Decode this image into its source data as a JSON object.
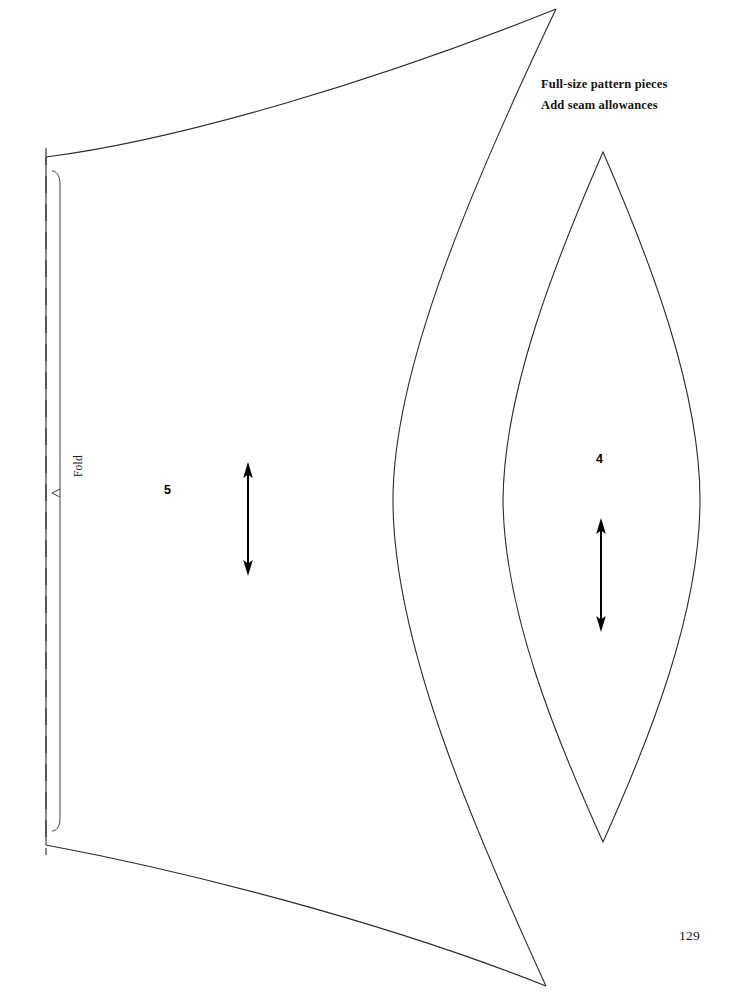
{
  "sheet": {
    "title": "Full-size sewing pattern sheet",
    "background_color": "#ffffff",
    "ink_color": "#1a1a1a",
    "width": 740,
    "height": 1005
  },
  "notes": {
    "line1": "Full-size pattern pieces",
    "line2": "Add seam allowances"
  },
  "page": {
    "number": "129"
  },
  "pieces": [
    {
      "id": "piece-5",
      "label": "5",
      "label_x": 164,
      "label_y": 483,
      "shape": "fold-edge panel with concave top and bottom curves",
      "fold_label": "Fold",
      "grainline": {
        "x": 248,
        "y_top": 464,
        "y_bottom": 574,
        "style": "double-headed-arrow"
      }
    },
    {
      "id": "piece-4",
      "label": "4",
      "label_x": 596,
      "label_y": 452,
      "shape": "lens / pointed oval",
      "grainline": {
        "x": 601,
        "y_top": 520,
        "y_bottom": 630,
        "style": "double-headed-arrow"
      }
    }
  ],
  "markings": {
    "fold_line_style": "long-dashed",
    "fold_line_x": 46,
    "fold_line_y_top": 148,
    "fold_line_y_bottom": 855,
    "seam_line_x": 60,
    "fold_tick": "small arrow pointing to fold line"
  },
  "colors": {
    "paper": "#ffffff",
    "line": "#2a2a2a",
    "text": "#111111",
    "arrow": "#000000"
  }
}
